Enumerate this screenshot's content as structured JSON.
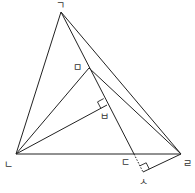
{
  "diagram": {
    "type": "geometry-figure",
    "points": {
      "giyeok": {
        "label": "ㄱ",
        "x": 61,
        "y": 12
      },
      "nieun": {
        "label": "ㄴ",
        "x": 16,
        "y": 154
      },
      "digeut": {
        "label": "ㄷ",
        "x": 134,
        "y": 154
      },
      "rieul": {
        "label": "ㄹ",
        "x": 181,
        "y": 154
      },
      "mieum": {
        "label": "ㅁ",
        "x": 89,
        "y": 68
      },
      "bieup": {
        "label": "ㅂ",
        "x": 107,
        "y": 105
      },
      "siot": {
        "label": "ㅅ",
        "x": 143,
        "y": 172
      }
    },
    "segments": [
      "ㄱㄴ",
      "ㄱㄹ",
      "ㄱㄷ",
      "ㄴㄹ",
      "ㄴㅁ",
      "ㄴㅂ",
      "ㅁㄹ",
      "ㄹㅅ"
    ],
    "dotted_segments": [
      "ㄷㅅ"
    ],
    "right_angles": [
      "ㅂ",
      "ㅅ"
    ]
  },
  "labels": {
    "giyeok": "ㄱ",
    "nieun": "ㄴ",
    "digeut": "ㄷ",
    "rieul": "ㄹ",
    "mieum": "ㅁ",
    "bieup": "ㅂ",
    "siot": "ㅅ"
  }
}
